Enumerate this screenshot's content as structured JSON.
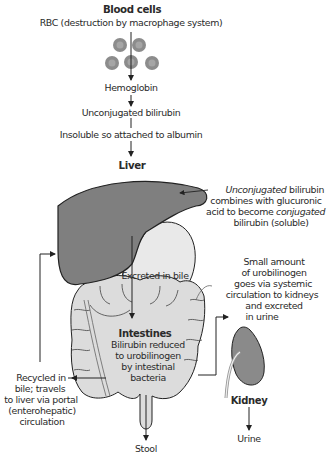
{
  "diagram": {
    "blood_cells": {
      "heading": "Blood cells",
      "subtitle": "RBC (destruction by macrophage system)"
    },
    "flow": {
      "hemoglobin": "Hemoglobin",
      "unconjugated": "Unconjugated bilirubin",
      "albumin": "Insoluble so attached to albumin"
    },
    "liver": {
      "heading": "Liver",
      "note_line1_italic": "Unconjugated",
      "note_line1_rest": " bilirubin",
      "note_line2": "combines with glucuronic",
      "note_line3_prefix": "acid to become ",
      "note_line3_italic": "conjugated",
      "note_line4": "bilirubin (soluble)"
    },
    "bile": {
      "label": "Excreted in bile"
    },
    "intestines": {
      "heading": "Intestines",
      "line1": "Bilirubin reduced",
      "line2": "to urobilinogen",
      "line3": "by intestinal",
      "line4": "bacteria"
    },
    "systemic": {
      "line1": "Small amount",
      "line2": "of urobilinogen",
      "line3": "goes via systemic",
      "line4": "circulation to kidneys",
      "line5": "and excreted",
      "line6": "in urine"
    },
    "recycled": {
      "line1": "Recycled in",
      "line2": "bile; travels",
      "line3": "to liver via portal",
      "line4": "(enterohepatic)",
      "line5": "circulation"
    },
    "kidney": {
      "heading": "Kidney",
      "output": "Urine"
    },
    "stool": "Stool",
    "colors": {
      "liver": "#7f7f7f",
      "intestine": "#dcdcdc",
      "stomach": "#e9e9e9",
      "kidney": "#8a8a8a",
      "rbc": "#8c8c8c",
      "line": "#222222"
    }
  }
}
